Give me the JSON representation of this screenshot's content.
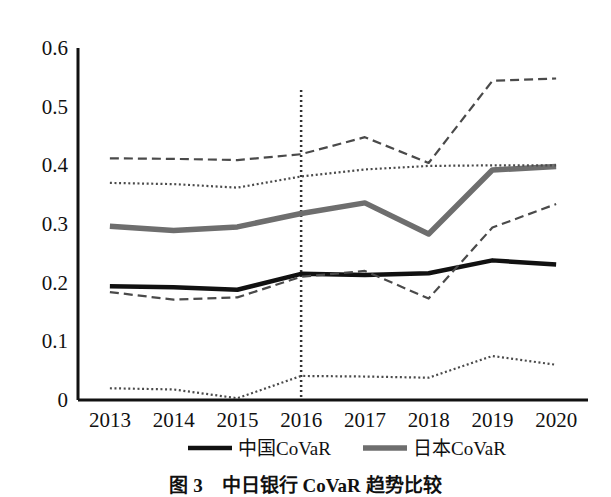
{
  "chart_data": {
    "type": "line",
    "title": "",
    "xlabel": "",
    "ylabel": "",
    "x": [
      "2013",
      "2014",
      "2015",
      "2016",
      "2017",
      "2018",
      "2019",
      "2020"
    ],
    "categories": [
      "2013",
      "2014",
      "2015",
      "2016",
      "2017",
      "2018",
      "2019",
      "2020"
    ],
    "ylim": [
      0,
      0.6
    ],
    "yticks": [
      "0",
      "0.1",
      "0.2",
      "0.3",
      "0.4",
      "0.5",
      "0.6"
    ],
    "ytick_values": [
      0,
      0.1,
      0.2,
      0.3,
      0.4,
      0.5,
      0.6
    ],
    "grid": false,
    "legend_position": "below-axis",
    "series": [
      {
        "name": "中国CoVaR",
        "style": "solid-black-thick",
        "color": "#111111",
        "values": [
          0.194,
          0.192,
          0.188,
          0.215,
          0.213,
          0.216,
          0.238,
          0.231
        ]
      },
      {
        "name": "日本CoVaR",
        "style": "solid-gray-thick",
        "color": "#6e6e6e",
        "values": [
          0.296,
          0.289,
          0.295,
          0.318,
          0.336,
          0.283,
          0.392,
          0.398
        ]
      },
      {
        "name": "upper-dashed-band",
        "style": "dashed",
        "color": "#4a4a4a",
        "values": [
          0.412,
          0.411,
          0.409,
          0.419,
          0.448,
          0.404,
          0.544,
          0.548
        ]
      },
      {
        "name": "upper-dotted-band",
        "style": "dotted",
        "color": "#4a4a4a",
        "values": [
          0.37,
          0.368,
          0.362,
          0.381,
          0.393,
          0.399,
          0.4,
          0.4
        ]
      },
      {
        "name": "lower-dashed-band",
        "style": "dashed",
        "color": "#4a4a4a",
        "values": [
          0.184,
          0.171,
          0.175,
          0.21,
          0.22,
          0.173,
          0.294,
          0.334
        ]
      },
      {
        "name": "lower-dotted-band",
        "style": "dotted",
        "color": "#4a4a4a",
        "values": [
          0.02,
          0.018,
          0.003,
          0.041,
          0.04,
          0.038,
          0.075,
          0.06
        ]
      }
    ],
    "annotations": [
      {
        "name": "vertical-reference-line-2016",
        "type": "vline",
        "x": "2016",
        "style": "dotted"
      }
    ],
    "legend": [
      {
        "label": "中国CoVaR",
        "marker": "solid-black-thick"
      },
      {
        "label": "日本CoVaR",
        "marker": "solid-gray-thick"
      }
    ]
  },
  "caption": {
    "text": "图 3　中日银行 CoVaR 趋势比较"
  }
}
